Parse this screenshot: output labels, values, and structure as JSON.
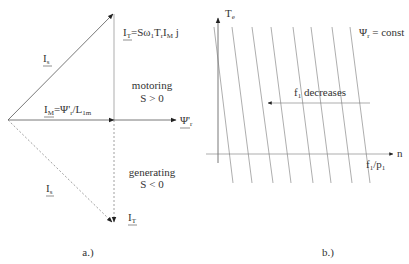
{
  "figure_a": {
    "caption": "a.)",
    "labels": {
      "is_top": {
        "main": "I",
        "sub": "s"
      },
      "it_formula": {
        "main": "I",
        "sub": "T",
        "rest": "=Sω",
        "sub2": "1",
        "rest2": "T",
        "sub3": "r",
        "rest3": "I",
        "sub4": "M",
        "rest4": " j"
      },
      "im_formula": {
        "main": "I",
        "sub": "M",
        "rest": "=Ψ'",
        "sub2": "r",
        "rest2": "/L",
        "sub3": "1m"
      },
      "psi": {
        "main": "Ψ'",
        "sub": "r"
      },
      "motoring": "motoring",
      "motoring_cond": "S > 0",
      "generating": "generating",
      "generating_cond": "S < 0",
      "is_bottom": {
        "main": "I",
        "sub": "s"
      },
      "it_bottom": {
        "main": "I",
        "sub": "T"
      }
    }
  },
  "figure_b": {
    "caption": "b.)",
    "y_axis": {
      "main": "T",
      "sub": "e"
    },
    "x_axis": "n",
    "x_marker": {
      "main": "f",
      "sub": "1",
      "rest": "/p",
      "sub2": "1"
    },
    "curve_label": {
      "main": "Ψ",
      "sub": "r",
      "rest": " = const"
    },
    "arrow_label": {
      "main": "f",
      "sub": "1",
      "rest": " decreases"
    }
  },
  "colors": {
    "line": "#555555",
    "text": "#333333",
    "background": "#ffffff"
  }
}
